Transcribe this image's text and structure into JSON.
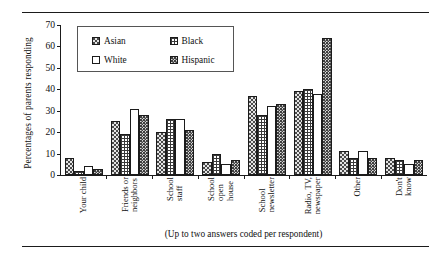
{
  "chart_data": {
    "type": "bar",
    "title": "",
    "xlabel": "",
    "ylabel": "Percentages of parents responding",
    "ylim": [
      0,
      70
    ],
    "yticks": [
      0,
      10,
      20,
      30,
      40,
      50,
      60,
      70
    ],
    "grid": false,
    "legend_position": "top-center",
    "categories": [
      "Your child",
      "Friends or neighbors",
      "School staff",
      "School open house",
      "School newsletter",
      "Radio, TV, newspaper",
      "Other",
      "Don't know"
    ],
    "category_lines": [
      [
        "Your child"
      ],
      [
        "Friends or",
        "neighbors"
      ],
      [
        "School",
        "staff"
      ],
      [
        "School",
        "open",
        "house"
      ],
      [
        "School",
        "newsletter"
      ],
      [
        "Radio, TV,",
        "newspaper"
      ],
      [
        "Other"
      ],
      [
        "Don't",
        "know"
      ]
    ],
    "series": [
      {
        "name": "Asian",
        "fill": "asian",
        "values": [
          8,
          25,
          20,
          6,
          37,
          39,
          11,
          8
        ]
      },
      {
        "name": "Black",
        "fill": "black",
        "values": [
          2,
          19,
          26,
          10,
          28,
          40,
          8,
          7
        ]
      },
      {
        "name": "White",
        "fill": "white",
        "values": [
          4,
          31,
          26,
          5,
          32,
          38,
          11,
          5
        ]
      },
      {
        "name": "Hispanic",
        "fill": "hispanic",
        "values": [
          3,
          28,
          21,
          7,
          33,
          64,
          8,
          7
        ]
      }
    ],
    "annotations": {
      "caption": "(Up to two answers coded per respondent)"
    }
  }
}
